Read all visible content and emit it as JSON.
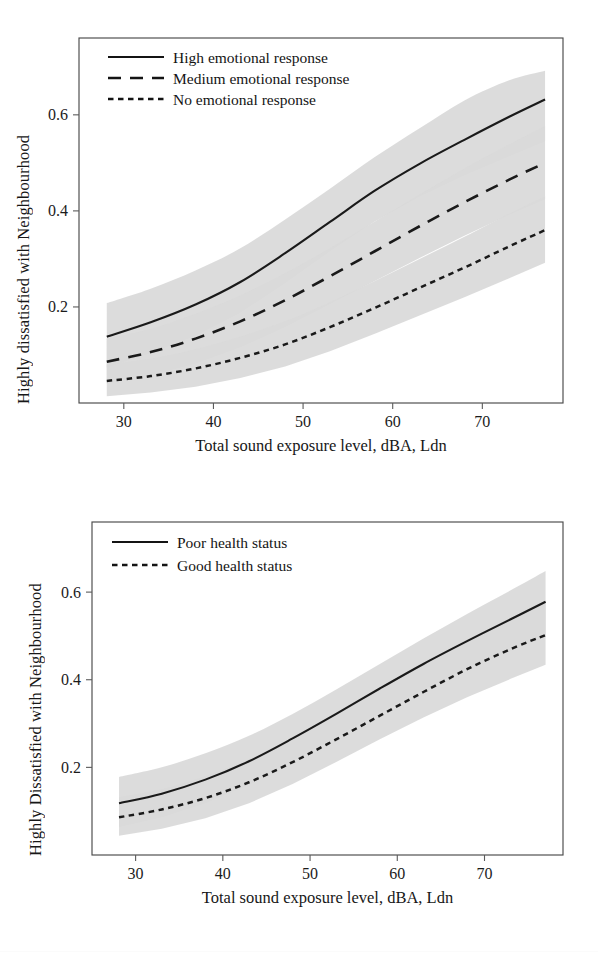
{
  "figure": {
    "background": "#ffffff",
    "band_color": "#d9d9d9",
    "line_color": "#1a1a1a"
  },
  "chart_data": [
    {
      "type": "line",
      "panel": "top",
      "title": "",
      "xlabel": "Total sound exposure level, dBA, Ldn",
      "ylabel": "Highly dissatisfied with Neighbourhood",
      "xlim": [
        25.0,
        79.0
      ],
      "ylim": [
        0.0,
        0.76
      ],
      "xticks": [
        30,
        40,
        50,
        60,
        70
      ],
      "xticklabels": [
        "30",
        "40",
        "50",
        "60",
        "70"
      ],
      "yticks": [
        0.2,
        0.4,
        0.6
      ],
      "yticklabels": [
        "0.2",
        "0.4",
        "0.6"
      ],
      "grid": false,
      "legend_position": "top-left",
      "x": [
        28.1,
        33.0,
        38.0,
        43.0,
        48.0,
        53.0,
        58.0,
        63.0,
        68.0,
        73.0,
        77.0
      ],
      "series": [
        {
          "name": "High emotional response",
          "style": "solid",
          "values": [
            0.138,
            0.168,
            0.205,
            0.252,
            0.312,
            0.377,
            0.442,
            0.498,
            0.548,
            0.596,
            0.632
          ],
          "ci_lower": [
            0.074,
            0.104,
            0.14,
            0.188,
            0.25,
            0.316,
            0.378,
            0.43,
            0.474,
            0.514,
            0.545
          ],
          "ci_upper": [
            0.208,
            0.238,
            0.276,
            0.322,
            0.382,
            0.446,
            0.512,
            0.572,
            0.63,
            0.672,
            0.692
          ]
        },
        {
          "name": "Medium emotional response",
          "style": "dashed",
          "values": [
            0.086,
            0.106,
            0.134,
            0.17,
            0.214,
            0.264,
            0.316,
            0.368,
            0.418,
            0.465,
            0.5
          ],
          "ci_lower": [
            0.04,
            0.058,
            0.082,
            0.116,
            0.158,
            0.206,
            0.254,
            0.302,
            0.348,
            0.392,
            0.424
          ],
          "ci_upper": [
            0.134,
            0.154,
            0.186,
            0.224,
            0.27,
            0.322,
            0.378,
            0.434,
            0.488,
            0.538,
            0.576
          ]
        },
        {
          "name": "No emotional response",
          "style": "dotted",
          "values": [
            0.046,
            0.056,
            0.072,
            0.094,
            0.122,
            0.158,
            0.198,
            0.24,
            0.282,
            0.326,
            0.36
          ],
          "ci_lower": [
            0.014,
            0.022,
            0.034,
            0.052,
            0.076,
            0.108,
            0.144,
            0.182,
            0.22,
            0.26,
            0.292
          ],
          "ci_upper": [
            0.08,
            0.092,
            0.112,
            0.138,
            0.17,
            0.21,
            0.254,
            0.3,
            0.346,
            0.394,
            0.43
          ]
        }
      ],
      "legend": [
        {
          "label": "High emotional response",
          "style": "solid"
        },
        {
          "label": "Medium emotional response",
          "style": "dashed"
        },
        {
          "label": "No emotional response",
          "style": "dotted"
        }
      ]
    },
    {
      "type": "line",
      "panel": "bottom",
      "title": "",
      "xlabel": "Total sound exposure level, dBA, Ldn",
      "ylabel": "Highly Dissatisfied with Neighbourhood",
      "xlim": [
        25.0,
        79.0
      ],
      "ylim": [
        0.0,
        0.76
      ],
      "xticks": [
        30,
        40,
        50,
        60,
        70
      ],
      "xticklabels": [
        "30",
        "40",
        "50",
        "60",
        "70"
      ],
      "yticks": [
        0.2,
        0.4,
        0.6
      ],
      "yticklabels": [
        "0.2",
        "0.4",
        "0.6"
      ],
      "grid": false,
      "legend_position": "top-left",
      "x": [
        28.1,
        33.0,
        38.0,
        43.0,
        48.0,
        53.0,
        58.0,
        63.0,
        68.0,
        73.0,
        77.0
      ],
      "series": [
        {
          "name": "Poor health status",
          "style": "solid",
          "values": [
            0.118,
            0.14,
            0.172,
            0.214,
            0.266,
            0.322,
            0.38,
            0.436,
            0.488,
            0.538,
            0.578
          ],
          "ci_lower": [
            0.064,
            0.086,
            0.118,
            0.16,
            0.214,
            0.27,
            0.326,
            0.378,
            0.424,
            0.466,
            0.498
          ],
          "ci_upper": [
            0.178,
            0.2,
            0.232,
            0.272,
            0.322,
            0.378,
            0.436,
            0.494,
            0.55,
            0.604,
            0.648
          ]
        },
        {
          "name": "Good health status",
          "style": "dotted",
          "values": [
            0.086,
            0.104,
            0.13,
            0.166,
            0.212,
            0.264,
            0.318,
            0.372,
            0.424,
            0.47,
            0.502
          ],
          "ci_lower": [
            0.044,
            0.06,
            0.084,
            0.118,
            0.162,
            0.212,
            0.264,
            0.314,
            0.36,
            0.402,
            0.434
          ],
          "ci_upper": [
            0.132,
            0.15,
            0.18,
            0.218,
            0.266,
            0.32,
            0.376,
            0.432,
            0.488,
            0.54,
            0.578
          ]
        }
      ],
      "legend": [
        {
          "label": "Poor health status",
          "style": "solid"
        },
        {
          "label": "Good health status",
          "style": "dotted"
        }
      ]
    }
  ]
}
